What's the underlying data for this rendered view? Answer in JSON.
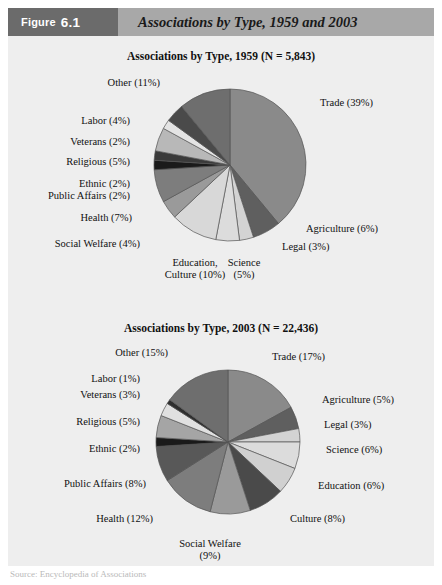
{
  "header": {
    "badge_label": "Figure",
    "badge_number": "6.1",
    "title": "Associations by Type, 1959 and 2003"
  },
  "footer": {
    "source_note": "Source: Encyclopedia of Associations"
  },
  "colors": {
    "badge_bg": "#6b6b6b",
    "header_bg": "#a8a8a8",
    "panel_bg": "#eeeeee",
    "page_bg": "#ffffff",
    "text": "#111111",
    "stroke": "#555555"
  },
  "chart_data": [
    {
      "id": "pie-1959",
      "type": "pie",
      "title": "Associations by Type, 1959 (N = 5,843)",
      "year": "1959",
      "n": "5,843",
      "unit": "percent",
      "start_angle_deg": -90,
      "direction": "clockwise",
      "center": [
        230,
        165
      ],
      "radius": 76,
      "labels_show_percent": true,
      "categories": [
        "Trade",
        "Agriculture",
        "Legal",
        "Science",
        "Education, Culture",
        "Social Welfare",
        "Health",
        "Public Affairs",
        "Ethnic",
        "Religious",
        "Veterans",
        "Labor",
        "Other"
      ],
      "values": [
        39,
        6,
        3,
        5,
        10,
        4,
        7,
        2,
        2,
        5,
        2,
        4,
        11
      ],
      "fills": [
        "#8a8a8a",
        "#5f5f5f",
        "#d3d3d3",
        "#dcdcdc",
        "#d8d8d8",
        "#9a9a9a",
        "#7d7d7d",
        "#1a1a1a",
        "#3a3a3a",
        "#b8b8b8",
        "#e4e4e4",
        "#4a4a4a",
        "#6e6e6e"
      ],
      "slice_labels": [
        {
          "text": "Trade (39%)",
          "lines": [
            "Trade (39%)"
          ],
          "x": 320,
          "y": 106,
          "anchor": "start"
        },
        {
          "text": "Agriculture (6%)",
          "lines": [
            "Agriculture (6%)"
          ],
          "x": 306,
          "y": 232,
          "anchor": "start"
        },
        {
          "text": "Legal (3%)",
          "lines": [
            "Legal (3%)"
          ],
          "x": 282,
          "y": 250,
          "anchor": "start"
        },
        {
          "text": "Science (5%)",
          "lines": [
            "Science",
            "(5%)"
          ],
          "x": 244,
          "y": 266,
          "anchor": "middle"
        },
        {
          "text": "Education, Culture (10%)",
          "lines": [
            "Education,",
            "Culture (10%)"
          ],
          "x": 195,
          "y": 266,
          "anchor": "middle"
        },
        {
          "text": "Social Welfare (4%)",
          "lines": [
            "Social Welfare (4%)"
          ],
          "x": 140,
          "y": 247,
          "anchor": "end"
        },
        {
          "text": "Health (7%)",
          "lines": [
            "Health (7%)"
          ],
          "x": 132,
          "y": 221,
          "anchor": "end"
        },
        {
          "text": "Public Affairs (2%)",
          "lines": [
            "Public Affairs (2%)"
          ],
          "x": 130,
          "y": 199,
          "anchor": "end"
        },
        {
          "text": "Ethnic (2%)",
          "lines": [
            "Ethnic (2%)"
          ],
          "x": 130,
          "y": 187,
          "anchor": "end"
        },
        {
          "text": "Religious (5%)",
          "lines": [
            "Religious (5%)"
          ],
          "x": 130,
          "y": 165,
          "anchor": "end"
        },
        {
          "text": "Veterans (2%)",
          "lines": [
            "Veterans (2%)"
          ],
          "x": 130,
          "y": 145,
          "anchor": "end"
        },
        {
          "text": "Labor (4%)",
          "lines": [
            "Labor (4%)"
          ],
          "x": 130,
          "y": 124,
          "anchor": "end"
        },
        {
          "text": "Other (11%)",
          "lines": [
            "Other (11%)"
          ],
          "x": 160,
          "y": 86,
          "anchor": "end"
        }
      ]
    },
    {
      "id": "pie-2003",
      "type": "pie",
      "title": "Associations by Type, 2003 (N = 22,436)",
      "year": "2003",
      "n": "22,436",
      "unit": "percent",
      "start_angle_deg": -90,
      "direction": "clockwise",
      "center": [
        228,
        442
      ],
      "radius": 72,
      "labels_show_percent": true,
      "categories": [
        "Trade",
        "Agriculture",
        "Legal",
        "Science",
        "Education",
        "Culture",
        "Social Welfare",
        "Health",
        "Public Affairs",
        "Ethnic",
        "Religious",
        "Veterans",
        "Labor",
        "Other"
      ],
      "values": [
        17,
        5,
        3,
        6,
        6,
        8,
        9,
        12,
        8,
        2,
        5,
        3,
        1,
        15
      ],
      "fills": [
        "#8a8a8a",
        "#5f5f5f",
        "#d3d3d3",
        "#dcdcdc",
        "#d0d0d0",
        "#4a4a4a",
        "#9a9a9a",
        "#7d7d7d",
        "#585858",
        "#1a1a1a",
        "#a5a5a5",
        "#e0e0e0",
        "#2e2e2e",
        "#6e6e6e"
      ],
      "slice_labels": [
        {
          "text": "Trade (17%)",
          "lines": [
            "Trade (17%)"
          ],
          "x": 272,
          "y": 360,
          "anchor": "start"
        },
        {
          "text": "Agriculture (5%)",
          "lines": [
            "Agriculture (5%)"
          ],
          "x": 322,
          "y": 403,
          "anchor": "start"
        },
        {
          "text": "Legal (3%)",
          "lines": [
            "Legal (3%)"
          ],
          "x": 324,
          "y": 428,
          "anchor": "start"
        },
        {
          "text": "Science (6%)",
          "lines": [
            "Science (6%)"
          ],
          "x": 326,
          "y": 453,
          "anchor": "start"
        },
        {
          "text": "Education (6%)",
          "lines": [
            "Education (6%)"
          ],
          "x": 318,
          "y": 489,
          "anchor": "start"
        },
        {
          "text": "Culture (8%)",
          "lines": [
            "Culture (8%)"
          ],
          "x": 290,
          "y": 522,
          "anchor": "start"
        },
        {
          "text": "Social Welfare (9%)",
          "lines": [
            "Social Welfare",
            "(9%)"
          ],
          "x": 210,
          "y": 547,
          "anchor": "middle"
        },
        {
          "text": "Health (12%)",
          "lines": [
            "Health (12%)"
          ],
          "x": 153,
          "y": 522,
          "anchor": "end"
        },
        {
          "text": "Public Affairs (8%)",
          "lines": [
            "Public Affairs (8%)"
          ],
          "x": 146,
          "y": 487,
          "anchor": "end"
        },
        {
          "text": "Ethnic (2%)",
          "lines": [
            "Ethnic (2%)"
          ],
          "x": 140,
          "y": 452,
          "anchor": "end"
        },
        {
          "text": "Religious (5%)",
          "lines": [
            "Religious (5%)"
          ],
          "x": 140,
          "y": 425,
          "anchor": "end"
        },
        {
          "text": "Veterans (3%)",
          "lines": [
            "Veterans (3%)"
          ],
          "x": 140,
          "y": 398,
          "anchor": "end"
        },
        {
          "text": "Labor (1%)",
          "lines": [
            "Labor (1%)"
          ],
          "x": 140,
          "y": 382,
          "anchor": "end"
        },
        {
          "text": "Other (15%)",
          "lines": [
            "Other (15%)"
          ],
          "x": 168,
          "y": 356,
          "anchor": "end"
        }
      ]
    }
  ]
}
